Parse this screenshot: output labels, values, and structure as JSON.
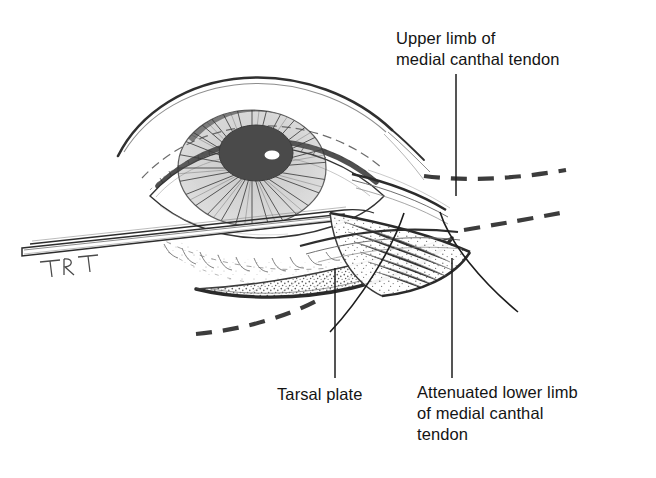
{
  "figure": {
    "kind": "anatomical-line-drawing",
    "background_color": "#ffffff",
    "ink_color": "#2b2b2b",
    "stipple_color": "#5d5d5d",
    "pupil_color": "#4a4a4a",
    "highlight_color": "#ffffff",
    "signature": "TRT"
  },
  "labels": {
    "upper_limb": "Upper limb of\nmedial canthal tendon",
    "tarsal_plate": "Tarsal plate",
    "attenuated_lower_limb": "Attenuated lower limb\nof medial canthal\ntendon"
  },
  "leader_lines": [
    {
      "name": "leader-upper-limb",
      "from": [
        456,
        74
      ],
      "to": [
        456,
        196
      ],
      "style": "straight"
    },
    {
      "name": "leader-tarsal-plate",
      "from": [
        335,
        268
      ],
      "to": [
        335,
        378
      ],
      "style": "straight"
    },
    {
      "name": "leader-attenuated-lower-limb",
      "from": [
        452,
        258
      ],
      "to": [
        452,
        378
      ],
      "style": "straight"
    },
    {
      "name": "pointer-curve-left",
      "from": [
        404,
        213
      ],
      "to": [
        330,
        330
      ],
      "style": "curved"
    },
    {
      "name": "pointer-curve-right",
      "from": [
        440,
        212
      ],
      "to": [
        518,
        310
      ],
      "style": "curved"
    }
  ],
  "dashed_guides": [
    {
      "name": "dashed-upper-right",
      "description": "upper dashed contour sweeping right from brow"
    },
    {
      "name": "dashed-lower-right",
      "description": "lower dashed contour sweeping right from lid"
    },
    {
      "name": "dashed-lower-left",
      "description": "dashed contour sweeping left below lower lid"
    }
  ],
  "anatomy_parts": [
    {
      "name": "eyebrow-arc",
      "label": "brow contour"
    },
    {
      "name": "upper-eyelid-crease",
      "label": "upper lid crease"
    },
    {
      "name": "upper-eyelashes",
      "label": "upper lashes"
    },
    {
      "name": "iris",
      "label": "iris with radiating fibers"
    },
    {
      "name": "pupil",
      "label": "pupil"
    },
    {
      "name": "corneal-highlight",
      "label": "specular highlight"
    },
    {
      "name": "lower-eyelid",
      "label": "lower eyelid"
    },
    {
      "name": "tarsal-plate",
      "label": "tarsal plate (stippled)"
    },
    {
      "name": "medial-canthal-tendon-upper-limb",
      "label": "upper limb of medial canthal tendon"
    },
    {
      "name": "medial-canthal-tendon-lower-limb",
      "label": "attenuated lower limb"
    },
    {
      "name": "surgical-retractor",
      "label": "retractor blade"
    }
  ]
}
